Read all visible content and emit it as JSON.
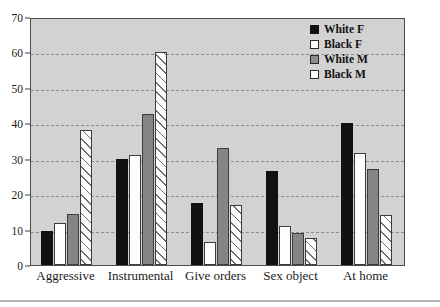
{
  "chart_data": {
    "type": "bar",
    "title": "",
    "subtitle": "",
    "xlabel": "",
    "ylabel": "",
    "ylim": [
      0,
      70
    ],
    "ytick_step": 10,
    "yticks": [
      0,
      10,
      20,
      30,
      40,
      50,
      60,
      70
    ],
    "grid": true,
    "grid_style": "dashed-horizontal",
    "legend_position": "top-right",
    "categories": [
      "Aggressive",
      "Instrumental",
      "Give orders",
      "Sex object",
      "At home"
    ],
    "series": [
      {
        "name": "White F",
        "swatch": "solid-black",
        "color": "#111111",
        "values": [
          9.5,
          30.0,
          17.5,
          26.5,
          40.0
        ]
      },
      {
        "name": "Black F",
        "swatch": "open-white",
        "color": "#ffffff",
        "values": [
          12.0,
          31.0,
          6.5,
          11.0,
          31.5
        ]
      },
      {
        "name": "White M",
        "swatch": "solid-gray",
        "color": "#858585",
        "values": [
          14.5,
          42.5,
          33.0,
          9.0,
          27.0
        ]
      },
      {
        "name": "Black M",
        "swatch": "hatched",
        "color": "#ffffff",
        "values": [
          38.0,
          60.0,
          17.0,
          7.5,
          14.0
        ]
      }
    ]
  },
  "legend": {
    "items": [
      {
        "label": "White F"
      },
      {
        "label": "Black F"
      },
      {
        "label": "White M"
      },
      {
        "label": "Black M"
      }
    ]
  },
  "colors": {
    "plot_background": "#d2d2d2",
    "frame": "#4a4a4a",
    "gridline": "#8d8d8d",
    "page_background": "#ffffff",
    "footer_rule": "#b4b4b4"
  }
}
